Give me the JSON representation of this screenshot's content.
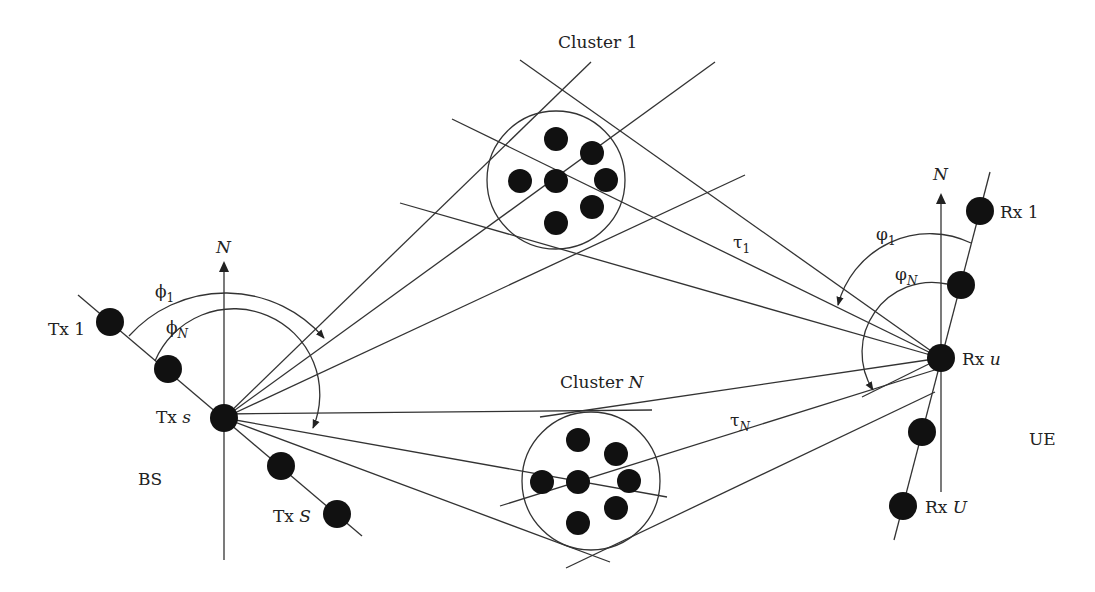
{
  "diagram": {
    "title_labels": {
      "cluster_1": "Cluster 1",
      "cluster_n_prefix": "Cluster ",
      "cluster_n_var": "N",
      "north_tx": "N",
      "north_rx": "N",
      "bs": "BS",
      "ue": "UE"
    },
    "transmitters": {
      "tx1_prefix": "Tx ",
      "tx1_id": "1",
      "txs_prefix": "Tx ",
      "txs_id": "s",
      "txS_prefix": "Tx ",
      "txS_id": "S"
    },
    "receivers": {
      "rx1_prefix": "Rx ",
      "rx1_id": "1",
      "rxu_prefix": "Rx ",
      "rxu_id": "u",
      "rxU_prefix": "Rx ",
      "rxU_id": "U"
    },
    "angles": {
      "phi_sym": "ϕ",
      "phi_1_sub": "1",
      "phi_N_sub": "N",
      "varphi_sym": "φ",
      "varphi_1_sub": "1",
      "varphi_N_sub": "N",
      "tau_sym": "τ",
      "tau_1_sub": "1",
      "tau_N_sub": "N"
    },
    "colors": {
      "line": "#333333",
      "dot": "#111111",
      "background": "#ffffff"
    }
  }
}
